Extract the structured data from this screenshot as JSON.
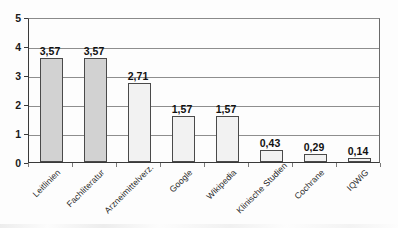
{
  "chart_data": {
    "type": "bar",
    "title": "",
    "xlabel": "",
    "ylabel": "",
    "ylim": [
      0,
      5
    ],
    "ytick_labels": [
      "0",
      "1",
      "2",
      "3",
      "4",
      "5"
    ],
    "grid": true,
    "legend": "none",
    "decimal_separator": ",",
    "categories": [
      "Leitlinien",
      "Fachliteratur",
      "Arzneimittelverz.",
      "Google",
      "Wikipedia",
      "Klinische Studien",
      "Cochrane",
      "IQWiG"
    ],
    "values": [
      3.57,
      3.57,
      2.71,
      1.57,
      1.57,
      0.43,
      0.29,
      0.14
    ],
    "value_labels": [
      "3,57",
      "3,57",
      "2,71",
      "1,57",
      "1,57",
      "0,43",
      "0,29",
      "0,14"
    ],
    "bar_colors": [
      "#d2d2d2",
      "#d2d2d2",
      "#f2f2f2",
      "#f2f2f2",
      "#f2f2f2",
      "#f2f2f2",
      "#f2f2f2",
      "#f2f2f2"
    ],
    "bar_border_color": "#4a4a4a",
    "axis_color": "#3a3a3a",
    "gridline_color": "#8e8e8e"
  }
}
